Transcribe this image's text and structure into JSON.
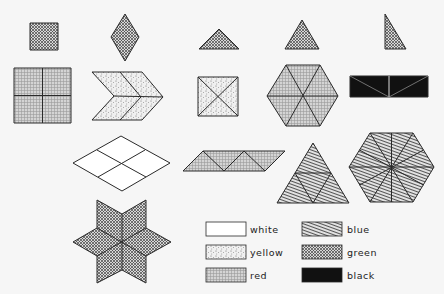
{
  "legend": {
    "items": [
      {
        "key": "white",
        "label": "white",
        "pattern": "white-fill"
      },
      {
        "key": "yellow",
        "label": "yellow",
        "pattern": "dots"
      },
      {
        "key": "red",
        "label": "red",
        "pattern": "grid"
      },
      {
        "key": "blue",
        "label": "blue",
        "pattern": "diagonal-lines"
      },
      {
        "key": "green",
        "label": "green",
        "pattern": "crosshatch"
      },
      {
        "key": "black",
        "label": "black",
        "pattern": "solid-black"
      }
    ]
  },
  "shapes": {
    "row1": [
      {
        "name": "small-square",
        "color": "green"
      },
      {
        "name": "small-rhombus",
        "color": "green"
      },
      {
        "name": "isosceles-triangle-wide",
        "color": "green"
      },
      {
        "name": "equilateral-triangle",
        "color": "green"
      },
      {
        "name": "right-triangle",
        "color": "green"
      }
    ],
    "row2": [
      {
        "name": "square-of-4-squares",
        "color": "red"
      },
      {
        "name": "chevron-of-4-rhombi",
        "color": "yellow"
      },
      {
        "name": "square-of-4-triangles",
        "color": "yellow"
      },
      {
        "name": "hexagon-of-6-triangles",
        "color": "red"
      },
      {
        "name": "rectangle-of-4-triangles",
        "color": "black"
      }
    ],
    "row3": [
      {
        "name": "rhombus-of-4-rhombi",
        "color": "white"
      },
      {
        "name": "parallelogram-of-4-triangles",
        "color": "red"
      },
      {
        "name": "large-triangle-of-4-triangles",
        "color": "blue"
      },
      {
        "name": "hexagon-of-12-triangles",
        "color": "blue"
      }
    ],
    "row4": [
      {
        "name": "six-point-star-of-6-rhombi",
        "color": "green"
      }
    ]
  },
  "colors": {
    "ink": "#2a2a2a",
    "background": "#f6f6f6",
    "black_fill": "#111111"
  }
}
